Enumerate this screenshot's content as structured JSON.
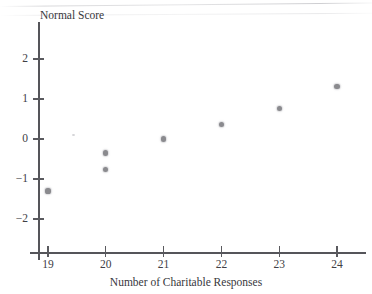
{
  "chart_data": {
    "type": "scatter",
    "title": "",
    "xlabel": "Number of Charitable Responses",
    "ylabel": "Normal Score",
    "xlim": [
      18.7,
      24.6
    ],
    "ylim": [
      -2.3,
      2.35
    ],
    "grid": false,
    "legend": "none",
    "marker_color": "#8a8a8e",
    "axis_color": "#55555a",
    "x_ticks": [
      "19",
      "20",
      "21",
      "22",
      "23",
      "24"
    ],
    "y_ticks": [
      "2",
      "1",
      "0",
      "−1",
      "−2"
    ],
    "x_tick_values": [
      19,
      20,
      21,
      22,
      23,
      24
    ],
    "y_tick_values": [
      2,
      1,
      0,
      -1,
      -2
    ],
    "points": [
      {
        "x": 19,
        "y": -1.3
      },
      {
        "x": 20,
        "y": -0.76
      },
      {
        "x": 20,
        "y": -0.35
      },
      {
        "x": 21,
        "y": 0.0
      },
      {
        "x": 22,
        "y": 0.37
      },
      {
        "x": 23,
        "y": 0.76
      },
      {
        "x": 24,
        "y": 1.32
      }
    ]
  }
}
